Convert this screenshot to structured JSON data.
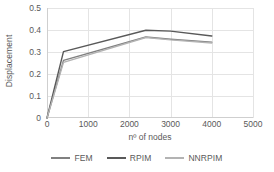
{
  "chart_data": {
    "type": "line",
    "title": "",
    "xlabel": "nº of nodes",
    "ylabel": "Displacement",
    "xlim": [
      0,
      5000
    ],
    "ylim": [
      0,
      0.5
    ],
    "x_ticks": [
      0,
      1000,
      2000,
      3000,
      4000,
      5000
    ],
    "x_tick_labels": [
      "0",
      "1000",
      "2000",
      "3000",
      "4000",
      "5000"
    ],
    "y_ticks": [
      0,
      0.1,
      0.2,
      0.3,
      0.4,
      0.5
    ],
    "y_tick_labels": [
      "0",
      "0.1",
      "0.2",
      "0.3",
      "0.4",
      "0.5"
    ],
    "grid": true,
    "legend_position": "bottom",
    "x": [
      0,
      400,
      2400,
      3000,
      4000
    ],
    "series": [
      {
        "name": "FEM",
        "color": "#808080",
        "values": [
          0,
          0.262,
          0.368,
          0.358,
          0.345
        ]
      },
      {
        "name": "RPIM",
        "color": "#595959",
        "values": [
          0,
          0.302,
          0.399,
          0.395,
          0.373
        ]
      },
      {
        "name": "NNRPIM",
        "color": "#b3b3b3",
        "values": [
          0,
          0.253,
          0.366,
          0.355,
          0.341
        ]
      }
    ]
  },
  "axes": {
    "y_title": "Displacement",
    "x_title": "nº of nodes"
  },
  "legend": {
    "items": [
      {
        "label": "FEM",
        "color": "#808080"
      },
      {
        "label": "RPIM",
        "color": "#595959"
      },
      {
        "label": "NNRPIM",
        "color": "#b3b3b3"
      }
    ]
  },
  "colors": {
    "gridline": "#e4e4e4",
    "axis": "#cfcfcf",
    "text": "#595959",
    "background": "#ffffff"
  }
}
